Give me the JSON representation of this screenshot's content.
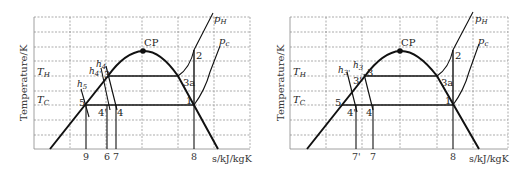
{
  "left": {
    "ylabel": "Temperature/K",
    "xlabel": "s/kJ/kgK",
    "isotherms": {
      "hot": "T",
      "hot_sub": "H",
      "cold": "T",
      "cold_sub": "C"
    },
    "critical_point": "CP",
    "pressure_lines": {
      "high": "p",
      "high_sub": "H",
      "low": "p",
      "low_sub": "c"
    },
    "enthalpy_labels": {
      "h4": "h",
      "h4_sub": "4",
      "h4p": "h",
      "h4p_sub": "4'",
      "h5": "h",
      "h5_sub": "5"
    },
    "points": {
      "p1": "1",
      "p2": "2",
      "p3": "3",
      "p3a": "3a",
      "p4": "4",
      "p4p": "4'",
      "p5": "5"
    },
    "x_ticks": [
      "9",
      "6",
      "7",
      "8"
    ]
  },
  "right": {
    "ylabel": "Temperature/K",
    "xlabel": "s/kJ/kgK",
    "isotherms": {
      "hot": "T",
      "hot_sub": "H",
      "cold": "T",
      "cold_sub": "C"
    },
    "critical_point": "CP",
    "pressure_lines": {
      "high": "p",
      "high_sub": "H",
      "low": "p",
      "low_sub": "c"
    },
    "enthalpy_labels": {
      "h3": "h",
      "h3_sub": "3",
      "h3p": "h",
      "h3p_sub": "3'"
    },
    "points": {
      "p1": "1",
      "p2": "2",
      "p3": "3",
      "p3p": "3'",
      "p3a": "3a",
      "p4": "4",
      "p4p": "4'",
      "p5": "5"
    },
    "x_ticks": [
      "7'",
      "7",
      "8"
    ]
  },
  "colors": {
    "curve": "#111111",
    "grid": "#777777",
    "text": "#222222"
  }
}
